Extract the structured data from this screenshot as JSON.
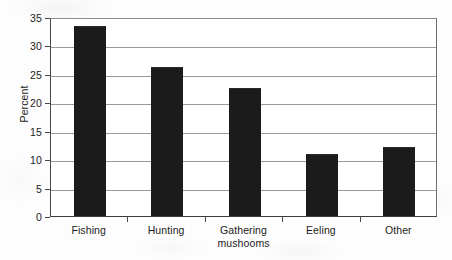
{
  "chart_data": {
    "type": "bar",
    "title": "",
    "xlabel": "",
    "ylabel": "Percent",
    "categories": [
      "Fishing",
      "Hunting",
      "Gathering mushooms",
      "Eeling",
      "Other"
    ],
    "category_lines": [
      [
        "Fishing"
      ],
      [
        "Hunting"
      ],
      [
        "Gathering",
        "mushooms"
      ],
      [
        "Eeling"
      ],
      [
        "Other"
      ]
    ],
    "values": [
      33.3,
      26.1,
      22.4,
      10.7,
      11.9
    ],
    "ylim": [
      0,
      35
    ],
    "ytick_labels": [
      "0",
      "5",
      "10",
      "15",
      "20",
      "25",
      "30",
      "35"
    ],
    "ytick_values": [
      0,
      5,
      10,
      15,
      20,
      25,
      30,
      35
    ],
    "grid": true,
    "legend": "none",
    "bar_color": "#1b1b1b",
    "grid_color": "#9a9a9a",
    "axis_color": "#4a4a4a",
    "background_color": "#ffffff"
  }
}
